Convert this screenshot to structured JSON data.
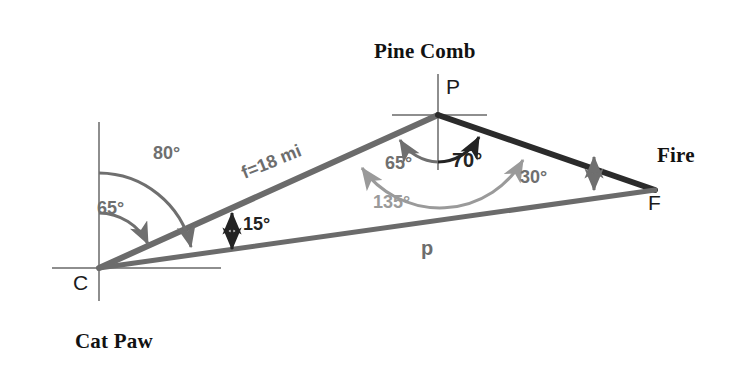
{
  "diagram": {
    "title_type": "triangle-bearing-diagram",
    "background_color": "#ffffff",
    "colors": {
      "side_dark": "#2b2b2b",
      "side_mid": "#6b6b6b",
      "side_light": "#8a8a8a",
      "reference_line": "#8e8e8e",
      "arc_dark": "#232323",
      "arc_mid": "#6f6f6f",
      "arc_light": "#9a9a9a",
      "text_black": "#121212"
    },
    "places": [
      {
        "name": "pine-comb",
        "label": "Pine Comb"
      },
      {
        "name": "fire",
        "label": "Fire"
      },
      {
        "name": "cat-paw",
        "label": "Cat Paw"
      }
    ],
    "vertices": [
      {
        "name": "vertex-p",
        "label": "P",
        "x": 438,
        "y": 115
      },
      {
        "name": "vertex-f",
        "label": "F",
        "x": 655,
        "y": 190
      },
      {
        "name": "vertex-c",
        "label": "C",
        "x": 99,
        "y": 268
      }
    ],
    "sides": [
      {
        "name": "side-f",
        "label": "f=18 mi",
        "from": "C",
        "to": "P"
      },
      {
        "name": "side-p",
        "label": "p",
        "from": "C",
        "to": "F"
      },
      {
        "name": "side-cp-to-pf",
        "label": "",
        "from": "P",
        "to": "F"
      }
    ],
    "angles": [
      {
        "name": "angle-80",
        "label": "80°",
        "value": 80,
        "vertex": "C",
        "shade": "mid"
      },
      {
        "name": "angle-65-at-c",
        "label": "65°",
        "value": 65,
        "vertex": "C",
        "shade": "mid"
      },
      {
        "name": "angle-15",
        "label": "15°",
        "value": 15,
        "vertex": "C",
        "shade": "dark"
      },
      {
        "name": "angle-65-at-p",
        "label": "65°",
        "value": 65,
        "vertex": "P",
        "shade": "mid"
      },
      {
        "name": "angle-70",
        "label": "70°",
        "value": 70,
        "vertex": "P",
        "shade": "dark"
      },
      {
        "name": "angle-135",
        "label": "135°",
        "value": 135,
        "vertex": "P",
        "shade": "light"
      },
      {
        "name": "angle-30",
        "label": "30°",
        "value": 30,
        "vertex": "F",
        "shade": "mid"
      }
    ]
  }
}
